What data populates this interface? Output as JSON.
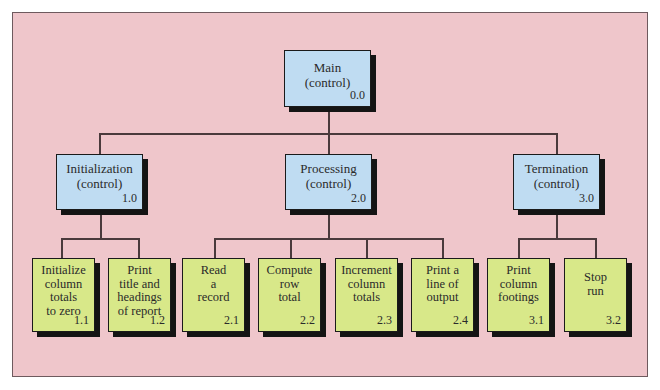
{
  "diagram": {
    "type": "hierarchy-chart",
    "colors": {
      "background": "#efc6cb",
      "control_box": "#bfdcf2",
      "leaf_box": "#d8e889",
      "lines": "#4a3a3c"
    },
    "root": {
      "label": "Main\n(control)",
      "number": "0.0"
    },
    "controls": [
      {
        "label": "Initialization\n(control)",
        "number": "1.0"
      },
      {
        "label": "Processing\n(control)",
        "number": "2.0"
      },
      {
        "label": "Termination\n(control)",
        "number": "3.0"
      }
    ],
    "leaves": [
      {
        "label": "Initialize\ncolumn\ntotals\nto zero",
        "number": "1.1"
      },
      {
        "label": "Print\ntitle and\nheadings\nof report",
        "number": "1.2"
      },
      {
        "label": "Read\na\nrecord",
        "number": "2.1"
      },
      {
        "label": "Compute\nrow\ntotal",
        "number": "2.2"
      },
      {
        "label": "Increment\ncolumn\ntotals",
        "number": "2.3"
      },
      {
        "label": "Print a\nline of\noutput",
        "number": "2.4"
      },
      {
        "label": "Print\ncolumn\nfootings",
        "number": "3.1"
      },
      {
        "label": "Stop\nrun",
        "number": "3.2"
      }
    ]
  }
}
